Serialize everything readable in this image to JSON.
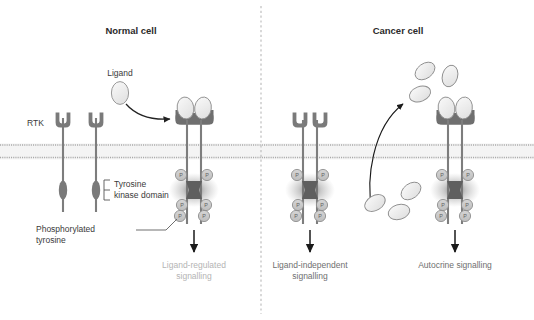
{
  "figure": {
    "type": "biological-diagram",
    "divider": "vertical-dashed-line"
  },
  "panels": [
    {
      "id": "normal",
      "title": "Normal cell",
      "labels": {
        "rtk": "RTK",
        "ligand": "Ligand",
        "tyrosine_kinase_domain": "Tyrosine\nkinase domain",
        "tyrosine_kinase_domain_line1": "Tyrosine",
        "tyrosine_kinase_domain_line2": "kinase domain",
        "phosphorylated_tyrosine_line1": "Phosphorylated",
        "phosphorylated_tyrosine_line2": "tyrosine",
        "signalling_line1": "Ligand-regulated",
        "signalling_line2": "signalling"
      },
      "monomer_receptors": 2,
      "dimer_receptors": 1,
      "ligands_bound": 2,
      "free_ligands": 1,
      "phosphate_count": 6,
      "signalling_text_color": "#b4b4b4"
    },
    {
      "id": "cancer",
      "title": "Cancer cell",
      "mechanisms": [
        {
          "id": "ligand-independent",
          "signalling_line1": "Ligand-independent",
          "signalling_line2": "signalling",
          "ligands_bound": 0,
          "phosphate_count": 6,
          "signalling_text_color": "#6f6f6f"
        },
        {
          "id": "autocrine",
          "signalling_line1": "Autocrine signalling",
          "signalling_line2": "",
          "ligands_bound": 2,
          "phosphate_count": 6,
          "signalling_text_color": "#6f6f6f"
        }
      ],
      "secreted_ligands_intracellular": 3,
      "secreted_ligands_extracellular": 3,
      "secretion_arrow": "curved-arrow-upward"
    }
  ],
  "glyphs": {
    "phosphate": "P"
  },
  "colors": {
    "receptor": "#7a7a7a",
    "receptor_dark": "#6a6a6a",
    "stalk": "#7d7d7d",
    "ligand_fill": "#ebebeb",
    "ligand_stroke": "#8e8e8e",
    "phosphate_fill": "#c9c9c9",
    "phosphate_stroke": "#8a8a8a",
    "membrane_band": "#f2f2f2",
    "membrane_line": "#a9a9a9",
    "divider": "#c9c9c9",
    "arrow": "#222222",
    "title_text": "#2b2b2b",
    "label_text": "#3a3a3a",
    "signal_light": "#b4b4b4",
    "signal_dark": "#6f6f6f",
    "background": "#ffffff"
  }
}
